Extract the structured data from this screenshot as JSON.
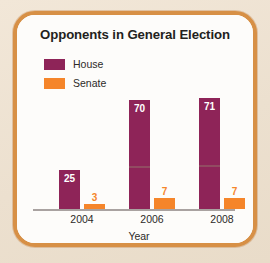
{
  "frame": {
    "border_color": "#d79046",
    "page_background": "#efe3d3",
    "card_background": "#fdfcfa"
  },
  "chart_data": {
    "type": "bar",
    "title": "Opponents in General Election",
    "xlabel": "Year",
    "ylabel": "",
    "categories": [
      "2004",
      "2006",
      "2008"
    ],
    "series": [
      {
        "name": "House",
        "color": "#8e2458",
        "values": [
          25,
          70,
          71
        ]
      },
      {
        "name": "Senate",
        "color": "#f5852a",
        "values": [
          3,
          7,
          7
        ]
      }
    ],
    "value_labels": {
      "house": [
        "25",
        "70",
        "71"
      ],
      "senate": [
        "3",
        "7",
        "7"
      ]
    },
    "ylim": [
      0,
      78
    ],
    "grid": false,
    "legend_position": "top-left",
    "axis_line_color": "#a9a2a0"
  },
  "legend": {
    "items": [
      {
        "label": "House",
        "color": "#8e2458"
      },
      {
        "label": "Senate",
        "color": "#f5852a"
      }
    ]
  }
}
